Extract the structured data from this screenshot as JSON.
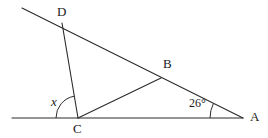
{
  "figure": {
    "kind": "geometry-diagram",
    "stroke_color": "#2b2b2b",
    "background_color": "#ffffff",
    "text_color": "#1a1a1a"
  },
  "points": {
    "D": {
      "label": "D",
      "x": 62,
      "y": 23
    },
    "B": {
      "label": "B",
      "x": 161,
      "y": 78
    },
    "A": {
      "label": "A",
      "x": 243,
      "y": 118
    },
    "C": {
      "label": "C",
      "x": 78,
      "y": 118
    },
    "ray_end_upper_left": {
      "x": 22,
      "y": 8
    },
    "base_left_end": {
      "x": 12,
      "y": 118
    }
  },
  "segments": [
    {
      "name": "transversal-DA",
      "from": "ray_end_upper_left",
      "to": "A"
    },
    {
      "name": "base-line",
      "from": "base_left_end",
      "to": "A"
    },
    {
      "name": "segment-DC",
      "from": "D",
      "to": "C"
    },
    {
      "name": "segment-CB",
      "from": "C",
      "to": "B"
    }
  ],
  "angles": {
    "at_C": {
      "label": "x",
      "value": "x",
      "italic": true,
      "arc_radius": 22
    },
    "at_A": {
      "label": "26°",
      "value": "26°",
      "italic": false,
      "arc_radius": 33
    }
  }
}
